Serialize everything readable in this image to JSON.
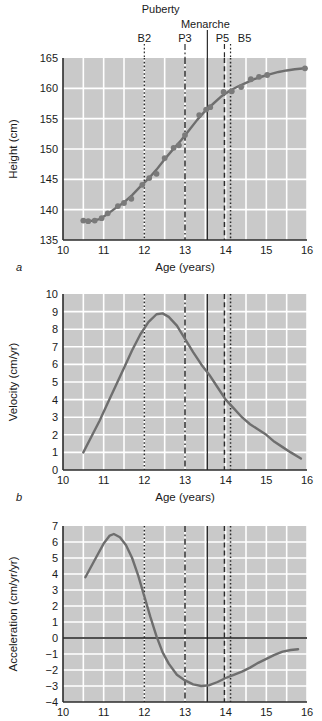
{
  "figure": {
    "background": "#ffffff",
    "plot_background": "#c9c9c9",
    "grid_color": "#ffffff",
    "curve_color": "#6e6e6e",
    "marker_color": "#7a7a7a",
    "axis_color": "#2b2b2b"
  },
  "annotations": {
    "group_labels": [
      {
        "name": "puberty",
        "text": "Puberty",
        "x": 12.5
      },
      {
        "name": "menarche",
        "text": "Menarche",
        "x": 13.55
      }
    ],
    "markers": [
      {
        "name": "B2",
        "label": "B2",
        "age": 12.0,
        "style": "dotted"
      },
      {
        "name": "P3",
        "label": "P3",
        "age": 13.0,
        "style": "dashdot"
      },
      {
        "name": "Menarche",
        "label": "",
        "age": 13.55,
        "style": "solid"
      },
      {
        "name": "P5",
        "label": "P5",
        "age": 13.97,
        "style": "dashed"
      },
      {
        "name": "B5",
        "label": "B5",
        "age": 14.12,
        "style": "dotted"
      }
    ]
  },
  "chart_data": [
    {
      "type": "line",
      "panel": "a",
      "panel_label": "a",
      "title": "",
      "xlabel": "Age (years)",
      "ylabel": "Height (cm)",
      "xlim": [
        10,
        16
      ],
      "ylim": [
        135,
        165
      ],
      "xticks": [
        10,
        11,
        12,
        13,
        14,
        15,
        16
      ],
      "yticks": [
        135,
        140,
        145,
        150,
        155,
        160,
        165
      ],
      "grid": true,
      "has_markers": true,
      "points": [
        {
          "x": 10.5,
          "y": 138.2
        },
        {
          "x": 10.62,
          "y": 138.1
        },
        {
          "x": 10.78,
          "y": 138.2
        },
        {
          "x": 10.95,
          "y": 138.6
        },
        {
          "x": 11.1,
          "y": 139.4
        },
        {
          "x": 11.35,
          "y": 140.6
        },
        {
          "x": 11.5,
          "y": 141.1
        },
        {
          "x": 11.68,
          "y": 141.8
        },
        {
          "x": 11.95,
          "y": 144.1
        },
        {
          "x": 12.12,
          "y": 145.2
        },
        {
          "x": 12.3,
          "y": 145.9
        },
        {
          "x": 12.5,
          "y": 148.5
        },
        {
          "x": 12.72,
          "y": 150.2
        },
        {
          "x": 12.85,
          "y": 150.6
        },
        {
          "x": 13.0,
          "y": 152.3
        },
        {
          "x": 13.35,
          "y": 155.6
        },
        {
          "x": 13.52,
          "y": 156.5
        },
        {
          "x": 13.62,
          "y": 156.9
        },
        {
          "x": 13.95,
          "y": 159.4
        },
        {
          "x": 14.15,
          "y": 159.5
        },
        {
          "x": 14.38,
          "y": 160.2
        },
        {
          "x": 14.62,
          "y": 161.5
        },
        {
          "x": 14.82,
          "y": 161.9
        },
        {
          "x": 15.02,
          "y": 162.2
        },
        {
          "x": 15.95,
          "y": 163.3
        }
      ],
      "curve": [
        {
          "x": 10.5,
          "y": 138.2
        },
        {
          "x": 10.7,
          "y": 138.15
        },
        {
          "x": 10.9,
          "y": 138.45
        },
        {
          "x": 11.1,
          "y": 139.3
        },
        {
          "x": 11.3,
          "y": 140.3
        },
        {
          "x": 11.5,
          "y": 141.2
        },
        {
          "x": 11.7,
          "y": 142.4
        },
        {
          "x": 11.9,
          "y": 143.8
        },
        {
          "x": 12.1,
          "y": 145.1
        },
        {
          "x": 12.3,
          "y": 146.6
        },
        {
          "x": 12.5,
          "y": 148.3
        },
        {
          "x": 12.7,
          "y": 149.9
        },
        {
          "x": 12.9,
          "y": 151.4
        },
        {
          "x": 13.1,
          "y": 153.1
        },
        {
          "x": 13.3,
          "y": 154.8
        },
        {
          "x": 13.5,
          "y": 156.3
        },
        {
          "x": 13.7,
          "y": 157.5
        },
        {
          "x": 13.9,
          "y": 158.7
        },
        {
          "x": 14.1,
          "y": 159.6
        },
        {
          "x": 14.3,
          "y": 160.3
        },
        {
          "x": 14.5,
          "y": 160.9
        },
        {
          "x": 14.7,
          "y": 161.5
        },
        {
          "x": 14.9,
          "y": 161.95
        },
        {
          "x": 15.1,
          "y": 162.35
        },
        {
          "x": 15.3,
          "y": 162.7
        },
        {
          "x": 15.5,
          "y": 162.95
        },
        {
          "x": 15.7,
          "y": 163.15
        },
        {
          "x": 15.95,
          "y": 163.3
        }
      ]
    },
    {
      "type": "line",
      "panel": "b",
      "panel_label": "b",
      "title": "",
      "xlabel": "Age (years)",
      "ylabel": "Velocity (cm/yr)",
      "xlim": [
        10,
        16
      ],
      "ylim": [
        0,
        10
      ],
      "xticks": [
        10,
        11,
        12,
        13,
        14,
        15,
        16
      ],
      "yticks": [
        0,
        1,
        2,
        3,
        4,
        5,
        6,
        7,
        8,
        9,
        10
      ],
      "grid": true,
      "has_markers": false,
      "curve": [
        {
          "x": 10.5,
          "y": 1.0
        },
        {
          "x": 10.7,
          "y": 1.9
        },
        {
          "x": 10.9,
          "y": 2.8
        },
        {
          "x": 11.1,
          "y": 3.8
        },
        {
          "x": 11.3,
          "y": 4.8
        },
        {
          "x": 11.5,
          "y": 5.8
        },
        {
          "x": 11.7,
          "y": 6.8
        },
        {
          "x": 11.9,
          "y": 7.7
        },
        {
          "x": 12.1,
          "y": 8.4
        },
        {
          "x": 12.3,
          "y": 8.85
        },
        {
          "x": 12.45,
          "y": 8.9
        },
        {
          "x": 12.6,
          "y": 8.7
        },
        {
          "x": 12.8,
          "y": 8.2
        },
        {
          "x": 13.0,
          "y": 7.45
        },
        {
          "x": 13.2,
          "y": 6.7
        },
        {
          "x": 13.4,
          "y": 6.0
        },
        {
          "x": 13.6,
          "y": 5.4
        },
        {
          "x": 13.8,
          "y": 4.7
        },
        {
          "x": 14.0,
          "y": 4.0
        },
        {
          "x": 14.2,
          "y": 3.5
        },
        {
          "x": 14.4,
          "y": 3.0
        },
        {
          "x": 14.6,
          "y": 2.6
        },
        {
          "x": 14.8,
          "y": 2.3
        },
        {
          "x": 15.0,
          "y": 2.0
        },
        {
          "x": 15.2,
          "y": 1.6
        },
        {
          "x": 15.4,
          "y": 1.3
        },
        {
          "x": 15.6,
          "y": 1.0
        },
        {
          "x": 15.85,
          "y": 0.65
        }
      ]
    },
    {
      "type": "line",
      "panel": "c",
      "panel_label": "",
      "title": "",
      "xlabel": "",
      "ylabel": "Acceleration (cm/yr/yr)",
      "xlim": [
        10,
        16
      ],
      "ylim": [
        -4,
        7
      ],
      "xticks": [
        10,
        11,
        12,
        13,
        14,
        15,
        16
      ],
      "yticks": [
        -4,
        -3,
        -2,
        -1,
        0,
        1,
        2,
        3,
        4,
        5,
        6,
        7
      ],
      "grid": true,
      "has_markers": false,
      "zero_line": 0,
      "curve": [
        {
          "x": 10.55,
          "y": 3.8
        },
        {
          "x": 10.7,
          "y": 4.5
        },
        {
          "x": 10.85,
          "y": 5.2
        },
        {
          "x": 11.0,
          "y": 5.9
        },
        {
          "x": 11.15,
          "y": 6.4
        },
        {
          "x": 11.25,
          "y": 6.5
        },
        {
          "x": 11.4,
          "y": 6.3
        },
        {
          "x": 11.55,
          "y": 5.8
        },
        {
          "x": 11.7,
          "y": 5.0
        },
        {
          "x": 11.85,
          "y": 3.9
        },
        {
          "x": 12.0,
          "y": 2.6
        },
        {
          "x": 12.15,
          "y": 1.3
        },
        {
          "x": 12.3,
          "y": 0.1
        },
        {
          "x": 12.45,
          "y": -0.9
        },
        {
          "x": 12.6,
          "y": -1.6
        },
        {
          "x": 12.8,
          "y": -2.3
        },
        {
          "x": 13.0,
          "y": -2.65
        },
        {
          "x": 13.2,
          "y": -2.9
        },
        {
          "x": 13.4,
          "y": -3.0
        },
        {
          "x": 13.6,
          "y": -2.95
        },
        {
          "x": 13.8,
          "y": -2.75
        },
        {
          "x": 14.0,
          "y": -2.5
        },
        {
          "x": 14.2,
          "y": -2.3
        },
        {
          "x": 14.4,
          "y": -2.1
        },
        {
          "x": 14.6,
          "y": -1.85
        },
        {
          "x": 14.8,
          "y": -1.55
        },
        {
          "x": 15.0,
          "y": -1.3
        },
        {
          "x": 15.2,
          "y": -1.05
        },
        {
          "x": 15.4,
          "y": -0.85
        },
        {
          "x": 15.6,
          "y": -0.75
        },
        {
          "x": 15.78,
          "y": -0.7
        }
      ]
    }
  ]
}
